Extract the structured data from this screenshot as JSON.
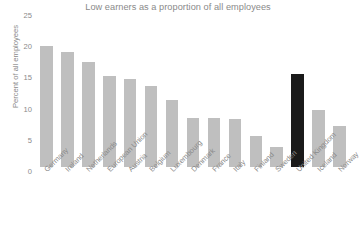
{
  "chart_data": {
    "type": "bar",
    "title": "Low earners as a proportion of all employees",
    "xlabel": "",
    "ylabel": "Percent of all employees",
    "ylim": [
      0,
      25
    ],
    "yticks": [
      0,
      5,
      10,
      15,
      20,
      25
    ],
    "grid": false,
    "legend": null,
    "categories": [
      "Germany",
      "Ireland",
      "Netherlands",
      "European Union",
      "Austria",
      "Belgium",
      "Luxembourg",
      "Denmark",
      "France",
      "Italy",
      "Finland",
      "Sweden",
      "United Kingdom",
      "Iceland",
      "Norway"
    ],
    "values": [
      20.9,
      19.8,
      18.1,
      15.7,
      15.2,
      14.0,
      11.6,
      8.5,
      8.4,
      8.3,
      5.3,
      3.4,
      16.1,
      9.8,
      7.1
    ],
    "highlight_category": "United Kingdom",
    "colors": {
      "bar": "#bfbfbf",
      "highlight_bar": "#1a1a1a",
      "text": "#8a8a8a",
      "background": "#ffffff"
    }
  }
}
